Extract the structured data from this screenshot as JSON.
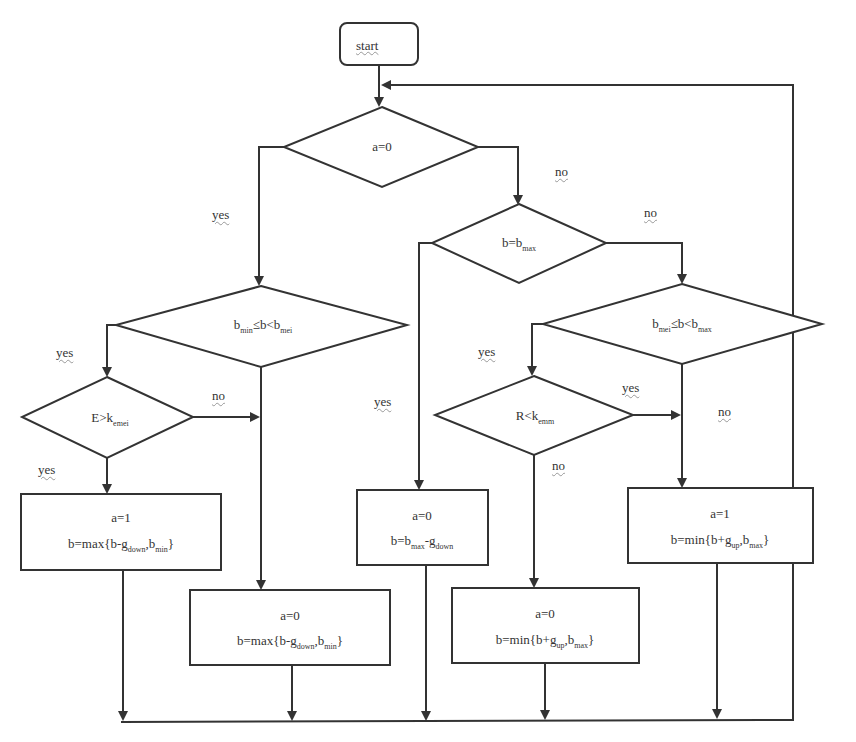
{
  "diagram": {
    "type": "flowchart",
    "start": {
      "label": "start"
    },
    "decisions": [
      {
        "id": "d1",
        "text": "a=0"
      },
      {
        "id": "d2",
        "text": "b=b",
        "sub": "max"
      },
      {
        "id": "d3",
        "pre": "b",
        "pre_sub": "min",
        "mid": "≤b<b",
        "post_sub": "mei"
      },
      {
        "id": "d4",
        "pre": "b",
        "pre_sub": "mei",
        "mid": "≤b<b",
        "post_sub": "max"
      },
      {
        "id": "d5",
        "text": "E>k",
        "sub": "emei"
      },
      {
        "id": "d6",
        "text": "R<k",
        "sub": "emm"
      }
    ],
    "processes": [
      {
        "id": "p1",
        "line1": "a=1",
        "line2_pre": "b=max{b-g",
        "line2_sub1": "down",
        "line2_mid": ",b",
        "line2_sub2": "min",
        "line2_post": "}"
      },
      {
        "id": "p2",
        "line1": "a=0",
        "line2_pre": "b=max{b-g",
        "line2_sub1": "down",
        "line2_mid": ",b",
        "line2_sub2": "min",
        "line2_post": "}"
      },
      {
        "id": "p3",
        "line1": "a=0",
        "line2_pre": "b=b",
        "line2_sub1": "max",
        "line2_mid": "-g",
        "line2_sub2": "down",
        "line2_post": ""
      },
      {
        "id": "p4",
        "line1": "a=0",
        "line2_pre": "b=min{b+g",
        "line2_sub1": "up",
        "line2_mid": ",b",
        "line2_sub2": "max",
        "line2_post": "}"
      },
      {
        "id": "p5",
        "line1": "a=1",
        "line2_pre": "b=min{b+g",
        "line2_sub1": "up",
        "line2_mid": ",b",
        "line2_sub2": "max",
        "line2_post": "}"
      }
    ],
    "edge_labels": {
      "d1_yes": "yes",
      "d1_no": "no",
      "d2_yes": "yes",
      "d2_no": "no",
      "d3_yes": "yes",
      "d3_no": "no",
      "d5_yes": "yes",
      "d4_yes": "yes",
      "d4_no": "no",
      "d6_yes": "yes",
      "d6_no": "no"
    },
    "colors": {
      "stroke": "#333333",
      "background": "#ffffff",
      "text": "#333333"
    }
  }
}
